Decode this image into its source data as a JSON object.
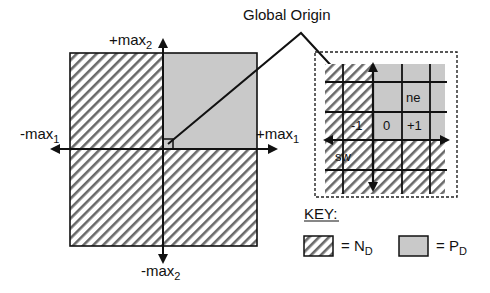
{
  "title_annotation": "Global Origin",
  "main_axes": {
    "y_pos": {
      "base": "+max",
      "sub": "2"
    },
    "y_neg": {
      "base": "-max",
      "sub": "2"
    },
    "x_pos": {
      "base": "+max",
      "sub": "1"
    },
    "x_neg": {
      "base": "-max",
      "sub": "1"
    }
  },
  "inset": {
    "cells": {
      "minus_one": "-1",
      "zero": "0",
      "plus_one": "+1",
      "ne": "ne",
      "sw": "sw"
    }
  },
  "key": {
    "title": "KEY:",
    "items": [
      {
        "pattern": "hatched",
        "label_prefix": "= N",
        "label_sub": "D"
      },
      {
        "pattern": "shaded",
        "label_prefix": "= P",
        "label_sub": "D"
      }
    ]
  },
  "colors": {
    "shade": "#c8c8c8",
    "hatch": "#555555",
    "line": "#111111"
  }
}
